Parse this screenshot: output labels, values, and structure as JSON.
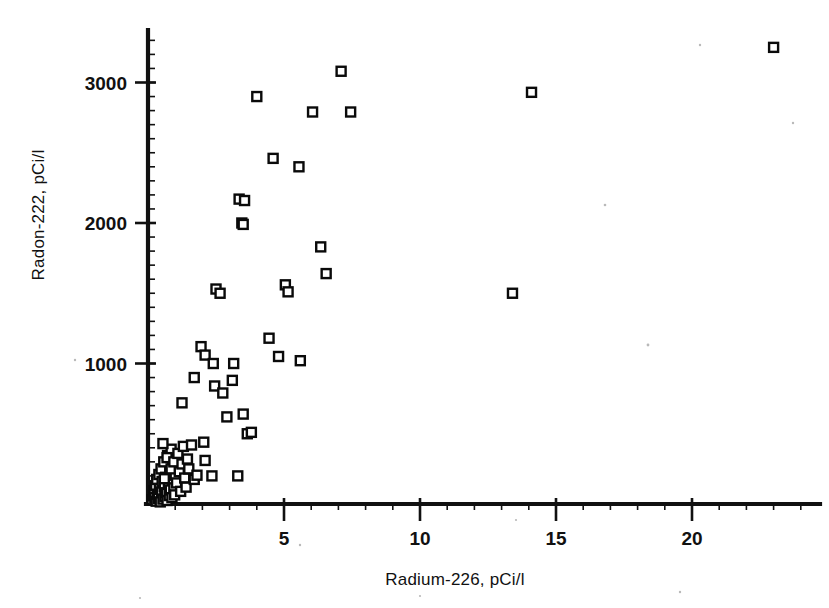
{
  "figure": {
    "background_color": "#ffffff",
    "ink_color": "#111111",
    "marker_shape": "open-square",
    "marker_fill": "#ffffff",
    "marker_stroke": "#0a0a0a"
  },
  "chart_data": {
    "type": "scatter",
    "title": "",
    "subtitle": "",
    "xlabel": "Radium-226, pCi/l",
    "ylabel": "Radon-222, pCi/l",
    "xlim": [
      0,
      24.2
    ],
    "ylim": [
      0,
      3450
    ],
    "xticks": [
      5,
      10,
      15,
      20
    ],
    "xticklabels": [
      "5",
      "10",
      "15",
      "20"
    ],
    "yticks": [
      1000,
      2000,
      3000
    ],
    "yticklabels": [
      "1000",
      "2000",
      "3000"
    ],
    "x_minor_tick_step": 1,
    "y_minor_tick_step": 100,
    "grid": false,
    "legend": null,
    "annotations": [],
    "series": [
      {
        "name": "Well samples",
        "marker": "open-square",
        "points": [
          [
            0.15,
            30
          ],
          [
            0.2,
            60
          ],
          [
            0.22,
            95
          ],
          [
            0.25,
            45
          ],
          [
            0.28,
            130
          ],
          [
            0.3,
            20
          ],
          [
            0.32,
            175
          ],
          [
            0.35,
            70
          ],
          [
            0.38,
            40
          ],
          [
            0.4,
            210
          ],
          [
            0.42,
            110
          ],
          [
            0.45,
            15
          ],
          [
            0.48,
            250
          ],
          [
            0.5,
            85
          ],
          [
            0.52,
            160
          ],
          [
            0.55,
            35
          ],
          [
            0.58,
            300
          ],
          [
            0.6,
            125
          ],
          [
            0.62,
            55
          ],
          [
            0.65,
            190
          ],
          [
            0.68,
            80
          ],
          [
            0.7,
            25
          ],
          [
            0.72,
            345
          ],
          [
            0.75,
            140
          ],
          [
            0.78,
            60
          ],
          [
            0.8,
            225
          ],
          [
            0.82,
            100
          ],
          [
            0.85,
            390
          ],
          [
            0.88,
            45
          ],
          [
            0.9,
            170
          ],
          [
            0.92,
            270
          ],
          [
            0.95,
            115
          ],
          [
            0.98,
            65
          ],
          [
            1.0,
            205
          ],
          [
            0.55,
            430
          ],
          [
            0.6,
            180
          ],
          [
            0.7,
            330
          ],
          [
            0.85,
            250
          ],
          [
            0.95,
            300
          ],
          [
            1.05,
            150
          ],
          [
            1.1,
            360
          ],
          [
            1.15,
            230
          ],
          [
            1.2,
            90
          ],
          [
            1.25,
            285
          ],
          [
            1.3,
            410
          ],
          [
            1.35,
            185
          ],
          [
            1.4,
            120
          ],
          [
            1.45,
            320
          ],
          [
            1.5,
            250
          ],
          [
            1.6,
            420
          ],
          [
            1.7,
            175
          ],
          [
            1.8,
            205
          ],
          [
            1.25,
            720
          ],
          [
            1.7,
            900
          ],
          [
            1.95,
            1120
          ],
          [
            2.1,
            1060
          ],
          [
            2.05,
            440
          ],
          [
            2.1,
            310
          ],
          [
            2.35,
            200
          ],
          [
            2.4,
            1000
          ],
          [
            2.45,
            840
          ],
          [
            2.5,
            1530
          ],
          [
            2.65,
            1500
          ],
          [
            2.75,
            790
          ],
          [
            2.9,
            620
          ],
          [
            3.1,
            880
          ],
          [
            3.15,
            1000
          ],
          [
            3.3,
            200
          ],
          [
            3.35,
            2170
          ],
          [
            3.55,
            2160
          ],
          [
            3.45,
            2000
          ],
          [
            3.5,
            1990
          ],
          [
            3.5,
            640
          ],
          [
            3.65,
            500
          ],
          [
            3.8,
            510
          ],
          [
            4.0,
            2900
          ],
          [
            4.45,
            1180
          ],
          [
            4.6,
            2460
          ],
          [
            4.8,
            1050
          ],
          [
            5.05,
            1560
          ],
          [
            5.15,
            1510
          ],
          [
            5.55,
            2400
          ],
          [
            5.6,
            1020
          ],
          [
            6.05,
            2790
          ],
          [
            6.35,
            1830
          ],
          [
            6.55,
            1640
          ],
          [
            7.1,
            3080
          ],
          [
            7.45,
            2790
          ],
          [
            13.4,
            1500
          ],
          [
            14.1,
            2930
          ],
          [
            23.0,
            3250
          ]
        ]
      }
    ]
  },
  "geometry": {
    "x_axis_pixel_origin": 148,
    "y_axis_pixel_origin": 504,
    "pixels_per_x_unit": 27.2,
    "pixels_per_y_unit": 0.1405
  }
}
